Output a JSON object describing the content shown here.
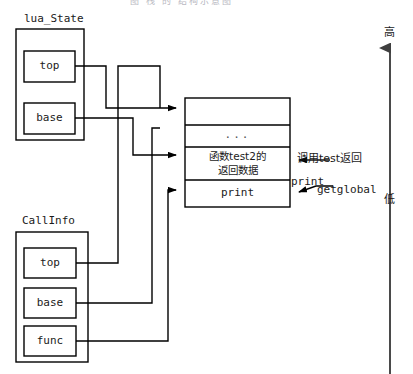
{
  "figure": {
    "type": "diagram",
    "cropped_caption_fragment": "图 栈 的 结构示意图"
  },
  "structs": {
    "lua_state": {
      "title": "lua_State",
      "fields": [
        {
          "name": "top",
          "label": "top"
        },
        {
          "name": "base",
          "label": "base"
        }
      ]
    },
    "callinfo": {
      "title": "CallInfo",
      "fields": [
        {
          "name": "top",
          "label": "top"
        },
        {
          "name": "base",
          "label": "base"
        },
        {
          "name": "func",
          "label": "func"
        }
      ]
    }
  },
  "stack": {
    "name": "lua-value-stack",
    "cells": [
      {
        "id": "empty-slot",
        "lines": [
          ""
        ]
      },
      {
        "id": "ellipsis-slot",
        "lines": [
          "..."
        ]
      },
      {
        "id": "test2-return-slot",
        "lines": [
          "函数test2的",
          "返回数据"
        ]
      },
      {
        "id": "print-slot",
        "lines": [
          "print"
        ]
      }
    ]
  },
  "annotations": {
    "call_test_return": "调用test返回",
    "getglobal_op": "getglobal",
    "getglobal_operand": "print"
  },
  "axis": {
    "name": "address-direction-axis",
    "high_label": "高",
    "low_label": "低",
    "direction": "up"
  },
  "colors": {
    "stroke": "#000000",
    "background": "#ffffff",
    "text": "#1a1a1a",
    "axis": "#4a4a4a",
    "faint": "#b9b9c2"
  }
}
